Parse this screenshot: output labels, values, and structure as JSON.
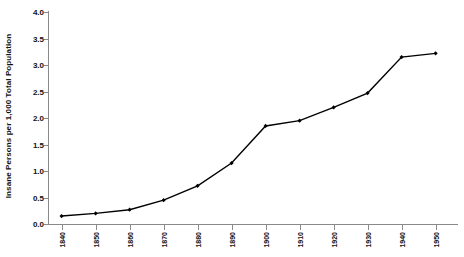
{
  "chart_data": {
    "type": "line",
    "title": "",
    "xlabel": "",
    "ylabel": "Insane Persons per 1,000 Total Population",
    "x": [
      1840,
      1850,
      1860,
      1870,
      1880,
      1890,
      1900,
      1910,
      1920,
      1930,
      1940,
      1950
    ],
    "xtick_labels": [
      "1840",
      "1850",
      "1860",
      "1870",
      "1880",
      "1890",
      "1900",
      "1910",
      "1920",
      "1930",
      "1940",
      "1950"
    ],
    "ytick_labels": [
      "0.0",
      "0.5",
      "1.0",
      "1.5",
      "2.0",
      "2.5",
      "3.0",
      "3.5",
      "4.0"
    ],
    "ytick_values": [
      0.0,
      0.5,
      1.0,
      1.5,
      2.0,
      2.5,
      3.0,
      3.5,
      4.0
    ],
    "values": [
      0.15,
      0.2,
      0.27,
      0.45,
      0.72,
      1.15,
      1.85,
      1.95,
      2.2,
      2.47,
      3.15,
      3.22
    ],
    "xlim": [
      1836,
      1956
    ],
    "ylim": [
      0.0,
      4.0
    ],
    "grid": false,
    "legend": false,
    "series": [
      {
        "name": "Insane Persons per 1,000 Total Population",
        "values": [
          0.15,
          0.2,
          0.27,
          0.45,
          0.72,
          1.15,
          1.85,
          1.95,
          2.2,
          2.47,
          3.15,
          3.22
        ],
        "line_color": "#000000",
        "marker": "diamond",
        "marker_color": "#000000"
      }
    ],
    "axis_color": "#8a8a8a",
    "background_color": "#ffffff"
  }
}
